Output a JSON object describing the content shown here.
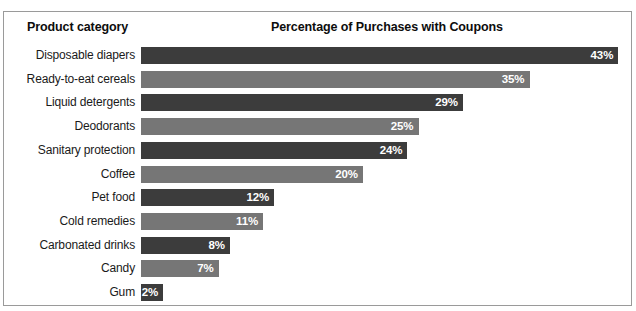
{
  "figure": {
    "header": {
      "category_column": "Product category",
      "value_column": "Percentage of Purchases with Coupons"
    },
    "colors": {
      "bar_dark": "#3c3c3c",
      "bar_light": "#767676",
      "frame_border": "#9a9a9a",
      "background": "#ffffff",
      "value_label": "#ffffff",
      "category_label": "#1a1a1a"
    }
  },
  "chart_data": {
    "type": "bar",
    "orientation": "horizontal",
    "title": "Percentage of Purchases with Coupons",
    "xlabel": "Percentage of Purchases with Coupons",
    "ylabel": "Product category",
    "xlim": [
      0,
      43
    ],
    "grid": false,
    "legend": "none",
    "value_suffix": "%",
    "categories": [
      "Disposable diapers",
      "Ready-to-eat cereals",
      "Liquid detergents",
      "Deodorants",
      "Sanitary protection",
      "Coffee",
      "Pet food",
      "Cold remedies",
      "Carbonated drinks",
      "Candy",
      "Gum"
    ],
    "values": [
      43,
      35,
      29,
      25,
      24,
      20,
      12,
      11,
      8,
      7,
      2
    ],
    "data_labels": [
      "43%",
      "35%",
      "29%",
      "25%",
      "24%",
      "20%",
      "12%",
      "11%",
      "8%",
      "7%",
      "2%"
    ],
    "bar_shades": [
      "dark",
      "light",
      "dark",
      "light",
      "dark",
      "light",
      "dark",
      "light",
      "dark",
      "light",
      "dark"
    ]
  }
}
